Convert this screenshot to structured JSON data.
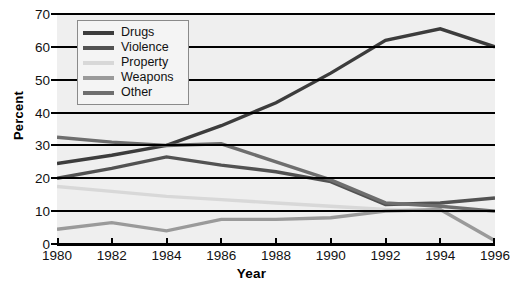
{
  "chart_data": {
    "type": "line",
    "title": "",
    "xlabel": "Year",
    "ylabel": "Percent",
    "x": [
      1980,
      1982,
      1984,
      1986,
      1988,
      1990,
      1992,
      1994,
      1996
    ],
    "xtick_labels": [
      "1980",
      "1982",
      "1984",
      "1986",
      "1988",
      "1990",
      "1992",
      "1994",
      "1996"
    ],
    "ytick_labels": [
      "0",
      "10",
      "20",
      "30",
      "40",
      "50",
      "60",
      "70"
    ],
    "ylim": [
      0,
      70
    ],
    "xlim": [
      1980,
      1996
    ],
    "ytick_step": 10,
    "grid": "horizontal",
    "legend_position": "upper-left",
    "series": [
      {
        "name": "Drugs",
        "color": "#3c3c3c",
        "values": [
          24.5,
          27.0,
          30.0,
          36.0,
          43.0,
          52.0,
          62.0,
          65.5,
          60.0
        ]
      },
      {
        "name": "Violence",
        "color": "#525252",
        "values": [
          20.0,
          23.0,
          26.5,
          24.0,
          22.0,
          19.0,
          12.0,
          12.5,
          14.0
        ]
      },
      {
        "name": "Property",
        "color": "#d8d8d8",
        "values": [
          17.5,
          16.0,
          14.5,
          13.5,
          12.5,
          11.5,
          10.5,
          10.0,
          10.0
        ]
      },
      {
        "name": "Weapons",
        "color": "#9a9a9a",
        "values": [
          4.5,
          6.5,
          4.0,
          7.5,
          7.5,
          8.0,
          10.0,
          10.5,
          1.0
        ]
      },
      {
        "name": "Other",
        "color": "#6e6e6e",
        "values": [
          32.5,
          31.0,
          30.0,
          30.5,
          25.0,
          19.5,
          12.5,
          11.5,
          10.0
        ]
      }
    ]
  },
  "legend": {
    "items": [
      {
        "label": "Drugs"
      },
      {
        "label": "Violence"
      },
      {
        "label": "Property"
      },
      {
        "label": "Weapons"
      },
      {
        "label": "Other"
      }
    ]
  },
  "colors": {
    "plot_background": "#efefef",
    "gridline": "#000000",
    "axis": "#000000",
    "text": "#111111"
  }
}
